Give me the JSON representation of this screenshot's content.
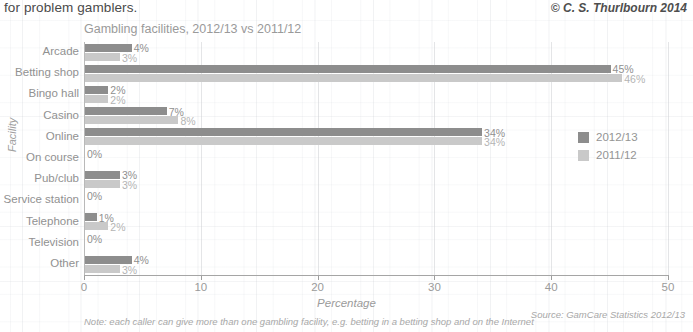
{
  "header": {
    "caption": "for problem gamblers.",
    "copyright": "© C. S. Thurlbourn 2014"
  },
  "footer": {
    "note": "Note: each caller can give more than one gambling facility, e.g. betting in a betting shop and on the Internet",
    "source": "Source: GamCare Statistics 2012/13"
  },
  "colors": {
    "series_2012_13": "#8d8d8d",
    "series_2011_12": "#c9c9c9",
    "text": "#949494",
    "axis": "#a5a5a5"
  },
  "chart_data": {
    "type": "bar",
    "orientation": "horizontal",
    "title": "Gambling facilities, 2012/13 vs 2011/12",
    "xlabel": "Percentage",
    "ylabel": "Facility",
    "xlim": [
      0,
      50
    ],
    "xticks": [
      0,
      10,
      20,
      30,
      40,
      50
    ],
    "grid": true,
    "legend_position": "right-middle",
    "categories": [
      "Arcade",
      "Betting shop",
      "Bingo hall",
      "Casino",
      "Online",
      "On course",
      "Pub/club",
      "Service station",
      "Telephone",
      "Television",
      "Other"
    ],
    "series": [
      {
        "name": "2012/13",
        "color": "#8d8d8d",
        "values": [
          4,
          45,
          2,
          7,
          34,
          0,
          3,
          0,
          1,
          0,
          4
        ],
        "labels": [
          "4%",
          "45%",
          "2%",
          "7%",
          "34%",
          "0%",
          "3%",
          "0%",
          "1%",
          "0%",
          "4%"
        ]
      },
      {
        "name": "2011/12",
        "color": "#c9c9c9",
        "values": [
          3,
          46,
          2,
          8,
          34,
          0,
          3,
          0,
          2,
          0,
          3
        ],
        "labels": [
          "3%",
          "46%",
          "2%",
          "8%",
          "34%",
          "",
          "3%",
          "",
          "2%",
          "",
          "3%"
        ]
      }
    ]
  }
}
